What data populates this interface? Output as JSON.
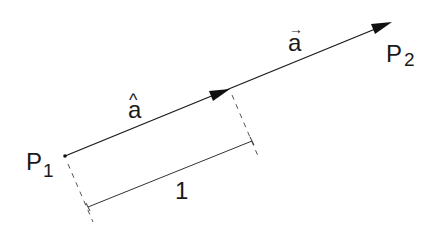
{
  "diagram": {
    "points": {
      "p1": {
        "label": "P",
        "subscript": "1",
        "x": 65,
        "y": 156
      },
      "p2": {
        "label": "P",
        "subscript": "2",
        "x": 391,
        "y": 22
      }
    },
    "vectors": {
      "a_vec": {
        "label": "a",
        "accent": "→"
      },
      "a_hat": {
        "label": "a",
        "accent": "^"
      }
    },
    "dimension": {
      "label": "1"
    },
    "colors": {
      "line": "#1a1a1a",
      "dash": "#555555",
      "background": "#ffffff"
    }
  }
}
